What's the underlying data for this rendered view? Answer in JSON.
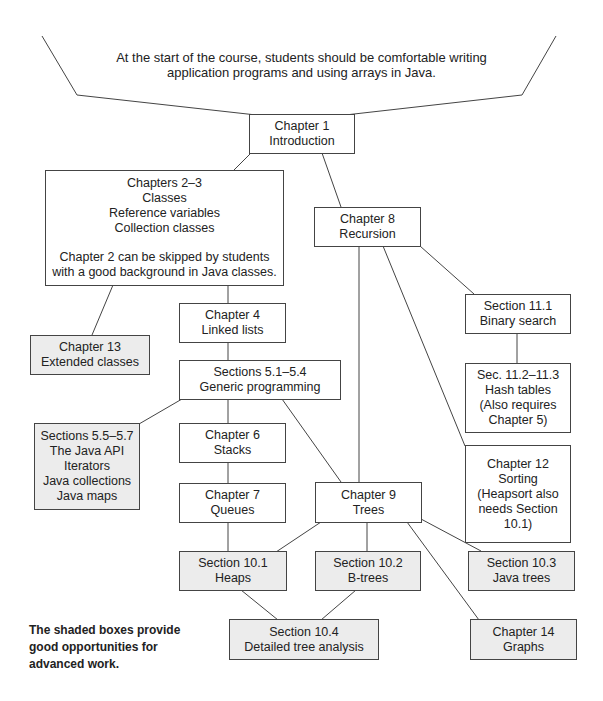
{
  "intro": {
    "lines": [
      "At the start of the course, students should be comfortable writing",
      "application programs and using arrays in Java."
    ]
  },
  "nodes": {
    "ch1": {
      "lines": [
        "Chapter 1",
        "Introduction"
      ],
      "shaded": false
    },
    "ch2_3": {
      "lines": [
        "Chapters 2–3",
        "Classes",
        "Reference variables",
        "Collection classes"
      ],
      "note_lines": [
        "Chapter 2 can be skipped by students",
        "with a good background in Java classes."
      ],
      "shaded": false
    },
    "ch8": {
      "lines": [
        "Chapter 8",
        "Recursion"
      ],
      "shaded": false
    },
    "ch4": {
      "lines": [
        "Chapter 4",
        "Linked lists"
      ],
      "shaded": false
    },
    "ch13": {
      "lines": [
        "Chapter 13",
        "Extended classes"
      ],
      "shaded": true
    },
    "sec11_1": {
      "lines": [
        "Section 11.1",
        "Binary search"
      ],
      "shaded": false
    },
    "sec5_1": {
      "lines": [
        "Sections 5.1–5.4",
        "Generic programming"
      ],
      "shaded": false
    },
    "sec11_2": {
      "lines": [
        "Sec. 11.2–11.3",
        "Hash tables",
        "(Also requires",
        "Chapter 5)"
      ],
      "shaded": false
    },
    "sec5_5": {
      "lines": [
        "Sections 5.5–5.7",
        "The Java API",
        "Iterators",
        "Java collections",
        "Java maps"
      ],
      "shaded": true
    },
    "ch6": {
      "lines": [
        "Chapter 6",
        "Stacks"
      ],
      "shaded": false
    },
    "ch12": {
      "lines": [
        "Chapter 12",
        "Sorting",
        "(Heapsort also",
        "needs Section",
        "10.1)"
      ],
      "shaded": false
    },
    "ch7": {
      "lines": [
        "Chapter 7",
        "Queues"
      ],
      "shaded": false
    },
    "ch9": {
      "lines": [
        "Chapter 9",
        "Trees"
      ],
      "shaded": false
    },
    "sec10_1": {
      "lines": [
        "Section 10.1",
        "Heaps"
      ],
      "shaded": true
    },
    "sec10_2": {
      "lines": [
        "Section 10.2",
        "B-trees"
      ],
      "shaded": true
    },
    "sec10_3": {
      "lines": [
        "Section 10.3",
        "Java trees"
      ],
      "shaded": true
    },
    "sec10_4": {
      "lines": [
        "Section 10.4",
        "Detailed tree analysis"
      ],
      "shaded": true
    },
    "ch14": {
      "lines": [
        "Chapter 14",
        "Graphs"
      ],
      "shaded": true
    }
  },
  "note": {
    "lines": [
      "The shaded boxes provide",
      "good opportunities for",
      "advanced work."
    ]
  },
  "edges": [
    [
      "intro",
      "ch1"
    ],
    [
      "ch1",
      "ch2_3"
    ],
    [
      "ch1",
      "ch8"
    ],
    [
      "ch2_3",
      "ch4"
    ],
    [
      "ch2_3",
      "ch13"
    ],
    [
      "ch4",
      "sec5_1"
    ],
    [
      "sec5_1",
      "sec5_5"
    ],
    [
      "sec5_1",
      "ch6"
    ],
    [
      "sec5_1",
      "ch9"
    ],
    [
      "ch6",
      "ch7"
    ],
    [
      "ch7",
      "sec10_1"
    ],
    [
      "ch8",
      "ch9"
    ],
    [
      "ch8",
      "ch12"
    ],
    [
      "ch8",
      "sec11_1"
    ],
    [
      "sec11_1",
      "sec11_2"
    ],
    [
      "ch9",
      "sec10_1"
    ],
    [
      "ch9",
      "sec10_2"
    ],
    [
      "ch9",
      "sec10_3"
    ],
    [
      "ch9",
      "ch14"
    ],
    [
      "sec10_1",
      "sec10_4"
    ],
    [
      "sec10_2",
      "sec10_4"
    ]
  ],
  "colors": {
    "shaded_fill": "#ececec",
    "line": "#444444",
    "background": "#ffffff"
  }
}
